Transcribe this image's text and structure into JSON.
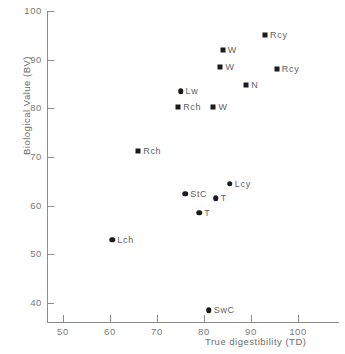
{
  "chart_data": {
    "type": "scatter",
    "title": "",
    "xlabel": "True digestibility (TD)",
    "ylabel": "Biological Value (BV)",
    "xlim": [
      45,
      105
    ],
    "ylim": [
      36,
      100
    ],
    "xticks": [
      50,
      60,
      70,
      80,
      90,
      100
    ],
    "yticks": [
      40,
      50,
      60,
      70,
      80,
      90,
      100
    ],
    "xtick_labels": [
      "50",
      "60",
      "70",
      "80",
      "90",
      "100"
    ],
    "ytick_labels": [
      "40",
      "50",
      "60",
      "70",
      "80",
      "90",
      "100"
    ],
    "grid": false,
    "legend": "none",
    "marker_color": "#1b1b1b",
    "axis_color": "#8d8d8d",
    "points": [
      {
        "label": "Rcy",
        "marker": "square",
        "x": 93.0,
        "y": 95.0
      },
      {
        "label": "W",
        "marker": "square",
        "x": 84.0,
        "y": 92.0
      },
      {
        "label": "W",
        "marker": "square",
        "x": 83.5,
        "y": 88.5
      },
      {
        "label": "Rcy",
        "marker": "square",
        "x": 95.5,
        "y": 88.0
      },
      {
        "label": "N",
        "marker": "square",
        "x": 89.0,
        "y": 84.7
      },
      {
        "label": "Lw",
        "marker": "circle",
        "x": 75.0,
        "y": 83.5
      },
      {
        "label": "Rch",
        "marker": "square",
        "x": 74.5,
        "y": 80.3
      },
      {
        "label": "W",
        "marker": "square",
        "x": 82.0,
        "y": 80.3
      },
      {
        "label": "Rch",
        "marker": "square",
        "x": 66.0,
        "y": 71.2
      },
      {
        "label": "Lcy",
        "marker": "circle",
        "x": 85.5,
        "y": 64.5
      },
      {
        "label": "StC",
        "marker": "circle",
        "x": 76.0,
        "y": 62.5
      },
      {
        "label": "T",
        "marker": "circle",
        "x": 82.5,
        "y": 61.5
      },
      {
        "label": "T",
        "marker": "circle",
        "x": 79.0,
        "y": 58.5
      },
      {
        "label": "Lch",
        "marker": "circle",
        "x": 60.5,
        "y": 53.0
      },
      {
        "label": "SwC",
        "marker": "circle",
        "x": 81.0,
        "y": 38.5
      }
    ]
  }
}
